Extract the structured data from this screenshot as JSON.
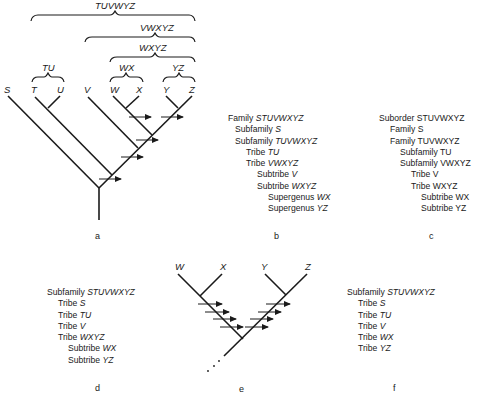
{
  "panel_a": {
    "letter": "a",
    "taxa": [
      "S",
      "T",
      "U",
      "V",
      "W",
      "X",
      "Y",
      "Z"
    ],
    "brackets": [
      "TUVWYZ",
      "VWXYZ",
      "WXYZ",
      "TU",
      "WX",
      "YZ"
    ]
  },
  "panel_b": {
    "letter": "b",
    "lines": [
      {
        "rank": "Family",
        "taxon": "STUVWXYZ"
      },
      {
        "rank": "Subfamily",
        "taxon": "S"
      },
      {
        "rank": "Subfamily",
        "taxon": "TUVWXYZ"
      },
      {
        "rank": "Tribe",
        "taxon": "TU"
      },
      {
        "rank": "Tribe",
        "taxon": "VWXYZ"
      },
      {
        "rank": "Subtribe",
        "taxon": "V"
      },
      {
        "rank": "Subtribe",
        "taxon": "WXYZ"
      },
      {
        "rank": "Supergenus",
        "taxon": "WX"
      },
      {
        "rank": "Supergenus",
        "taxon": "YZ"
      }
    ]
  },
  "panel_c": {
    "letter": "c",
    "lines": [
      {
        "rank": "Suborder",
        "taxon": "STUVWXYZ"
      },
      {
        "rank": "Family",
        "taxon": "S"
      },
      {
        "rank": "Family",
        "taxon": "TUVWXYZ"
      },
      {
        "rank": "Subfamily",
        "taxon": "TU"
      },
      {
        "rank": "Subfamily",
        "taxon": "VWXYZ"
      },
      {
        "rank": "Tribe",
        "taxon": "V"
      },
      {
        "rank": "Tribe",
        "taxon": "WXYZ"
      },
      {
        "rank": "Subtribe",
        "taxon": "WX"
      },
      {
        "rank": "Subtribe",
        "taxon": "YZ"
      }
    ]
  },
  "panel_d": {
    "letter": "d",
    "lines": [
      {
        "rank": "Subfamily",
        "taxon": "STUVWXYZ"
      },
      {
        "rank": "Tribe",
        "taxon": "S"
      },
      {
        "rank": "Tribe",
        "taxon": "TU"
      },
      {
        "rank": "Tribe",
        "taxon": "V"
      },
      {
        "rank": "Tribe",
        "taxon": "WXYZ"
      },
      {
        "rank": "Subtribe",
        "taxon": "WX"
      },
      {
        "rank": "Subtribe",
        "taxon": "YZ"
      }
    ]
  },
  "panel_e": {
    "letter": "e",
    "taxa": [
      "W",
      "X",
      "Y",
      "Z"
    ]
  },
  "panel_f": {
    "letter": "f",
    "lines": [
      {
        "rank": "Subfamily",
        "taxon": "STUVWXYZ"
      },
      {
        "rank": "Tribe",
        "taxon": "S"
      },
      {
        "rank": "Tribe",
        "taxon": "TU"
      },
      {
        "rank": "Tribe",
        "taxon": "V"
      },
      {
        "rank": "Tribe",
        "taxon": "WX"
      },
      {
        "rank": "Tribe",
        "taxon": "YZ"
      }
    ]
  }
}
